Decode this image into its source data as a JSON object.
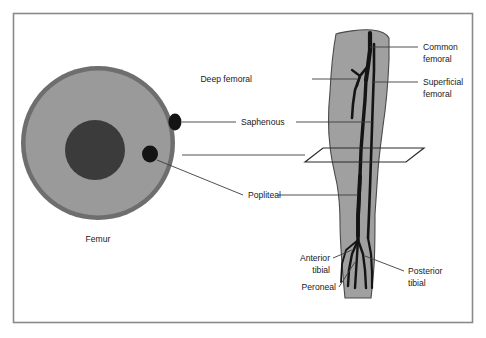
{
  "figure": {
    "title_present": false,
    "frame": {
      "name": "diagram-border",
      "color": "#8a8a8a"
    },
    "background": "#ffffff"
  },
  "colors": {
    "bone_cortex": "#6e6e6e",
    "cross_section_fill": "#9a9a9a",
    "marrow_fill": "#3b3b3b",
    "vessel_dark": "#1a1a1a",
    "leg_fill": "#a0a0a0",
    "leg_outline": "#4a4a4a",
    "leader_line": "#3c3c3c",
    "text": "#1a1a1a",
    "plane_outline": "#2a2a2a"
  },
  "cross_section": {
    "name": "femur-cross-section",
    "caption": "Femur",
    "vessels": [
      {
        "name": "saphenous-vessel-dot",
        "label_ref": "Saphenous"
      },
      {
        "name": "popliteal-vessel-dot",
        "label_ref": "Popliteal"
      }
    ]
  },
  "leg": {
    "name": "leg-longitudinal-view",
    "plane_marker": "cross-section-plane"
  },
  "labels": [
    {
      "id": "common-femoral",
      "lines": [
        "Common",
        "femoral"
      ],
      "side": "right"
    },
    {
      "id": "superficial-femoral",
      "lines": [
        "Superficial",
        "femoral"
      ],
      "side": "right"
    },
    {
      "id": "deep-femoral",
      "lines": [
        "Deep femoral"
      ],
      "side": "left"
    },
    {
      "id": "saphenous",
      "lines": [
        "Saphenous"
      ],
      "side": "left"
    },
    {
      "id": "popliteal",
      "lines": [
        "Popliteal"
      ],
      "side": "left"
    },
    {
      "id": "anterior-tibial",
      "lines": [
        "Anterior",
        "tibial"
      ],
      "side": "left"
    },
    {
      "id": "peroneal",
      "lines": [
        "Peroneal"
      ],
      "side": "left"
    },
    {
      "id": "posterior-tibial",
      "lines": [
        "Posterior",
        "tibial"
      ],
      "side": "right"
    },
    {
      "id": "femur",
      "lines": [
        "Femur"
      ],
      "side": "caption"
    }
  ],
  "text": {
    "common_femoral_1": "Common",
    "common_femoral_2": "femoral",
    "superficial_femoral_1": "Superficial",
    "superficial_femoral_2": "femoral",
    "deep_femoral": "Deep femoral",
    "saphenous": "Saphenous",
    "popliteal": "Popliteal",
    "anterior_tibial_1": "Anterior",
    "anterior_tibial_2": "tibial",
    "peroneal": "Peroneal",
    "posterior_tibial_1": "Posterior",
    "posterior_tibial_2": "tibial",
    "femur": "Femur"
  }
}
